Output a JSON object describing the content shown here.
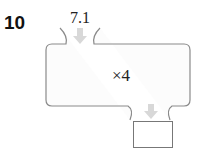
{
  "problem": {
    "number": "10",
    "input_value": "7.1",
    "operation": "×4",
    "answer": ""
  },
  "colors": {
    "outline": "#8a8a8a",
    "arrow": "#d8d8d8",
    "fill": "#fcfcfc"
  }
}
